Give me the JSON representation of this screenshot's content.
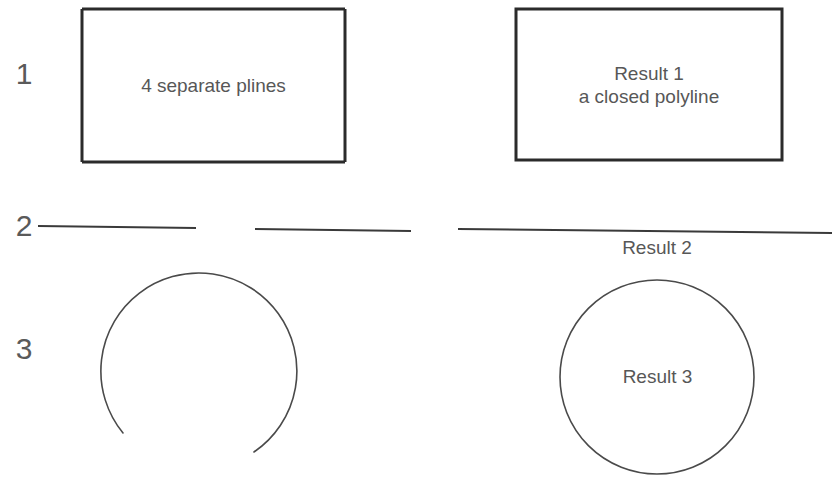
{
  "figure": {
    "background_color": "#ffffff",
    "stroke_color": "#2b2b2b",
    "thin_stroke_color": "#4a4a4a",
    "text_color": "#575757",
    "number_color": "#5a5a5a"
  },
  "rows": [
    {
      "number": "1",
      "before_label": "4 separate plines",
      "after_label": "Result 1\na closed polyline",
      "before_shape": "rectangle-from-four-plines",
      "after_shape": "closed-polyline-rectangle"
    },
    {
      "number": "2",
      "before_label": "",
      "after_label": "Result 2",
      "before_shape": "two-separate-line-segments",
      "after_shape": "single-joined-line"
    },
    {
      "number": "3",
      "before_label": "",
      "after_label": "Result 3",
      "before_shape": "open-arc-with-gap",
      "after_shape": "closed-circle"
    }
  ],
  "geometry": {
    "rect_before": {
      "x": 82,
      "y": 9,
      "width": 263,
      "height": 153
    },
    "rect_after": {
      "x": 516,
      "y": 9,
      "width": 266,
      "height": 151
    },
    "line_before_1": {
      "x1": 38,
      "y1": 226,
      "x2": 196,
      "y2": 228
    },
    "line_before_2": {
      "x1": 255,
      "y1": 229,
      "x2": 411,
      "y2": 231
    },
    "line_after": {
      "x1": 458,
      "y1": 229,
      "x2": 832,
      "y2": 233
    },
    "arc_before": {
      "cx": 200,
      "cy": 370,
      "r": 98,
      "gap_start_deg": 75,
      "gap_end_deg": 110
    },
    "circle_after": {
      "cx": 657,
      "cy": 377,
      "r": 97
    }
  }
}
